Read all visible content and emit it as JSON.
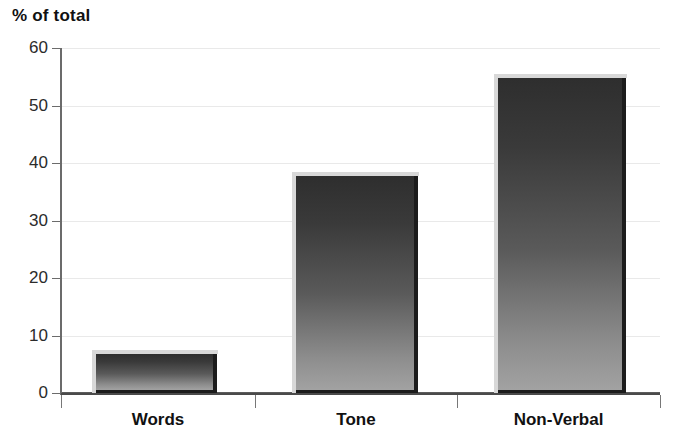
{
  "chart_data": {
    "type": "bar",
    "title": "% of total",
    "xlabel": "",
    "ylabel": "",
    "categories": [
      "Words",
      "Tone",
      "Non-Verbal"
    ],
    "values": [
      7,
      38,
      55
    ],
    "ylim": [
      0,
      60
    ],
    "yticks": [
      0,
      10,
      20,
      30,
      40,
      50,
      60
    ],
    "ytick_labels": [
      "0",
      "10",
      "20",
      "30",
      "40",
      "50",
      "60"
    ],
    "grid": true,
    "legend": "none",
    "bar_style": "vertical-gradient-dark-to-light",
    "colors": {
      "bar_top": "#2e2e2e",
      "bar_bottom": "#a2a2a2",
      "bar_edge": "#1c1c1c",
      "gridline": "#e9e9e9",
      "axis": "#4a4a4a",
      "text": "#111111",
      "background": "#ffffff"
    }
  }
}
